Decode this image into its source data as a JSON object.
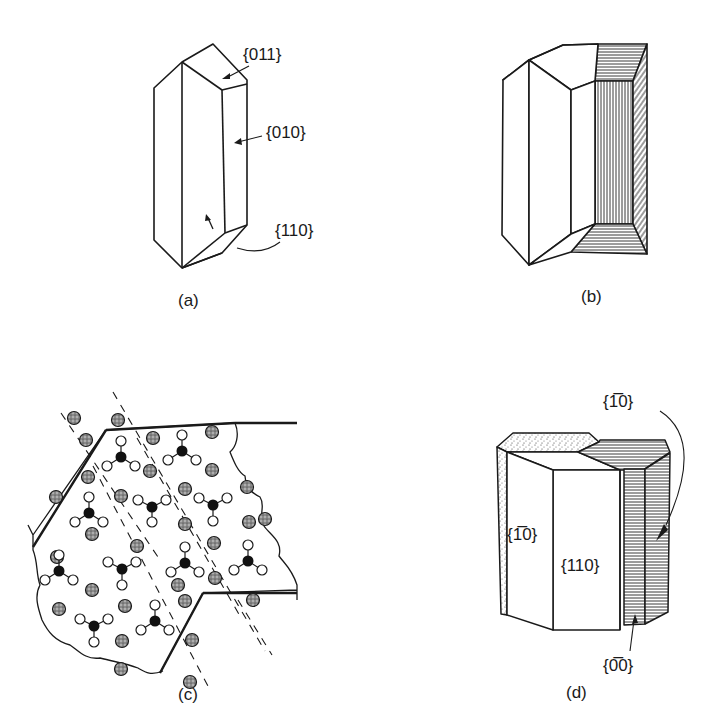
{
  "figure": {
    "panels": [
      {
        "id": "a",
        "label": "(a)",
        "faces": [
          "{011}",
          "{010}",
          "{110}"
        ]
      },
      {
        "id": "b",
        "label": "(b)",
        "faces": []
      },
      {
        "id": "c",
        "label": "(c)",
        "faces": []
      },
      {
        "id": "d",
        "label": "(d)",
        "faces": [
          "{1̅0}",
          "{110}",
          "{1̅0}",
          "{0̅0}"
        ]
      }
    ]
  },
  "panel_a": {
    "label": "(a)",
    "face_011": "{011}",
    "face_010": "{010}",
    "face_110": "{110}"
  },
  "panel_b": {
    "label": "(b)"
  },
  "panel_c": {
    "label": "(c)",
    "ions": [
      [
        74,
        418
      ],
      [
        118,
        420
      ],
      [
        86,
        440
      ],
      [
        153,
        438
      ],
      [
        212,
        432
      ],
      [
        88,
        477
      ],
      [
        150,
        471
      ],
      [
        212,
        470
      ],
      [
        56,
        497
      ],
      [
        121,
        496
      ],
      [
        185,
        489
      ],
      [
        247,
        487
      ],
      [
        92,
        534
      ],
      [
        185,
        524
      ],
      [
        249,
        522
      ],
      [
        57,
        557
      ],
      [
        137,
        546
      ],
      [
        214,
        543
      ],
      [
        265,
        519
      ],
      [
        92,
        590
      ],
      [
        178,
        585
      ],
      [
        215,
        578
      ],
      [
        253,
        600
      ],
      [
        59,
        609
      ],
      [
        125,
        606
      ],
      [
        185,
        601
      ],
      [
        122,
        641
      ],
      [
        192,
        640
      ],
      [
        121,
        669
      ],
      [
        190,
        682
      ]
    ],
    "units": [
      {
        "c": [
          121,
          457
        ],
        "o": [
          [
            121,
            441
          ],
          [
            107,
            466
          ],
          [
            135,
            466
          ]
        ]
      },
      {
        "c": [
          182,
          451
        ],
        "o": [
          [
            182,
            435
          ],
          [
            168,
            460
          ],
          [
            196,
            460
          ]
        ]
      },
      {
        "c": [
          89,
          513
        ],
        "o": [
          [
            89,
            497
          ],
          [
            75,
            522
          ],
          [
            103,
            522
          ]
        ]
      },
      {
        "c": [
          152,
          507
        ],
        "o": [
          [
            138,
            500
          ],
          [
            166,
            500
          ],
          [
            152,
            522
          ]
        ]
      },
      {
        "c": [
          213,
          505
        ],
        "o": [
          [
            199,
            498
          ],
          [
            227,
            498
          ],
          [
            213,
            521
          ]
        ]
      },
      {
        "c": [
          59,
          571
        ],
        "o": [
          [
            59,
            555
          ],
          [
            45,
            580
          ],
          [
            73,
            580
          ]
        ]
      },
      {
        "c": [
          122,
          569
        ],
        "o": [
          [
            108,
            562
          ],
          [
            136,
            562
          ],
          [
            122,
            585
          ]
        ]
      },
      {
        "c": [
          185,
          563
        ],
        "o": [
          [
            185,
            547
          ],
          [
            171,
            572
          ],
          [
            199,
            572
          ]
        ]
      },
      {
        "c": [
          248,
          561
        ],
        "o": [
          [
            248,
            545
          ],
          [
            234,
            570
          ],
          [
            262,
            570
          ]
        ]
      },
      {
        "c": [
          94,
          626
        ],
        "o": [
          [
            80,
            619
          ],
          [
            108,
            619
          ],
          [
            94,
            642
          ]
        ]
      },
      {
        "c": [
          155,
          621
        ],
        "o": [
          [
            155,
            605
          ],
          [
            141,
            630
          ],
          [
            169,
            630
          ]
        ]
      }
    ]
  },
  "panel_d": {
    "label": "(d)",
    "face_1m10_right": "{1̅0}",
    "face_1m10_left": "{1̅0}",
    "face_110": "{110}",
    "face_0m10": "{0̅0}"
  },
  "colors": {
    "ink": "#1a1a1a",
    "background": "#ffffff",
    "stipple": "#9a9a9a"
  }
}
